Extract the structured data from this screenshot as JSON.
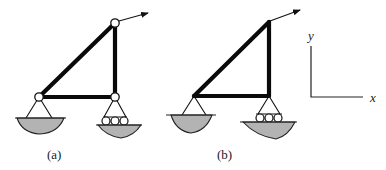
{
  "figure": {
    "panels": [
      {
        "id": "a",
        "label": "(a)",
        "description": "Triangular frame with pinned joints (hinges) at all three corners, pin support at left, roller support at right, inclined force at top joint",
        "joints": [
          "hinge",
          "hinge",
          "hinge"
        ]
      },
      {
        "id": "b",
        "label": "(b)",
        "description": "Triangular frame with rigid joints, pin support at left, roller support at right, inclined force at top joint",
        "joints": [
          "rigid",
          "rigid",
          "rigid"
        ]
      }
    ],
    "axes": {
      "x_label": "x",
      "y_label": "y"
    },
    "colors": {
      "member": "#0a0a0a",
      "ground_fill": "#b3b3b3",
      "background": "#ffffff"
    }
  }
}
